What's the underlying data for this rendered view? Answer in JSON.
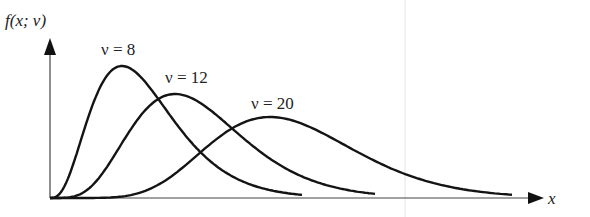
{
  "chart_data": {
    "type": "line",
    "title": "",
    "xlabel": "x",
    "ylabel": "f(x; ν)",
    "grid": false,
    "legend": "inline labels",
    "series": [
      {
        "name": "ν = 8",
        "nu": 8,
        "label": "ν = 8",
        "peak_x_px": 122,
        "peak_y_px": 66,
        "end_x_px": 302,
        "end_y_px": 192
      },
      {
        "name": "ν = 12",
        "nu": 12,
        "label": "ν = 12",
        "peak_x_px": 175,
        "peak_y_px": 94,
        "end_x_px": 375,
        "end_y_px": 192
      },
      {
        "name": "ν = 20",
        "nu": 20,
        "label": "ν = 20",
        "peak_x_px": 270,
        "peak_y_px": 117,
        "end_x_px": 512,
        "end_y_px": 190
      }
    ]
  },
  "axes": {
    "y_label": "f(x; ν)",
    "x_label": "x",
    "origin": [
      50,
      198
    ],
    "x_end": 535,
    "y_top": 40
  },
  "labels": {
    "nu8": "ν = 8",
    "nu12": "ν = 12",
    "nu20": "ν = 20"
  },
  "colors": {
    "curve": "#141414",
    "axis": "#333333",
    "guide": "#e3e3e3"
  }
}
